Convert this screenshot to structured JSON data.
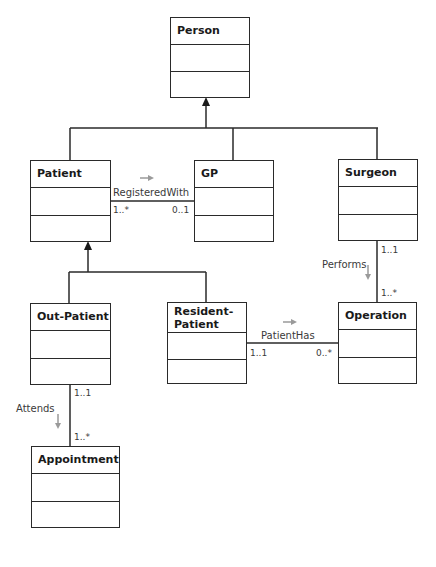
{
  "diagram": {
    "type": "UML class diagram",
    "classes": [
      {
        "id": "person",
        "name": "Person"
      },
      {
        "id": "patient",
        "name": "Patient"
      },
      {
        "id": "gp",
        "name": "GP"
      },
      {
        "id": "surgeon",
        "name": "Surgeon"
      },
      {
        "id": "out_patient",
        "name": "Out-Patient"
      },
      {
        "id": "resident_patient",
        "name": "Resident-\nPatient",
        "name_line1": "Resident-",
        "name_line2": "Patient"
      },
      {
        "id": "operation",
        "name": "Operation"
      },
      {
        "id": "appointment",
        "name": "Appointment"
      }
    ],
    "generalizations": [
      {
        "parent": "Person",
        "children": [
          "Patient",
          "GP",
          "Surgeon"
        ]
      },
      {
        "parent": "Patient",
        "children": [
          "Out-Patient",
          "Resident-Patient"
        ]
      }
    ],
    "associations": [
      {
        "name": "RegisteredWith",
        "from": "Patient",
        "to": "GP",
        "from_mult": "1..*",
        "to_mult": "0..1",
        "direction": "right"
      },
      {
        "name": "Performs",
        "from": "Surgeon",
        "to": "Operation",
        "from_mult": "1..1",
        "to_mult": "1..*",
        "direction": "down"
      },
      {
        "name": "PatientHas",
        "from": "Resident-Patient",
        "to": "Operation",
        "from_mult": "1..1",
        "to_mult": "0..*",
        "direction": "right"
      },
      {
        "name": "Attends",
        "from": "Out-Patient",
        "to": "Appointment",
        "from_mult": "1..1",
        "to_mult": "1..*",
        "direction": "down"
      }
    ]
  },
  "colors": {
    "line": "#2a2a2a",
    "direction_arrow": "#9a9a9a",
    "text": "#1a1a1a"
  }
}
